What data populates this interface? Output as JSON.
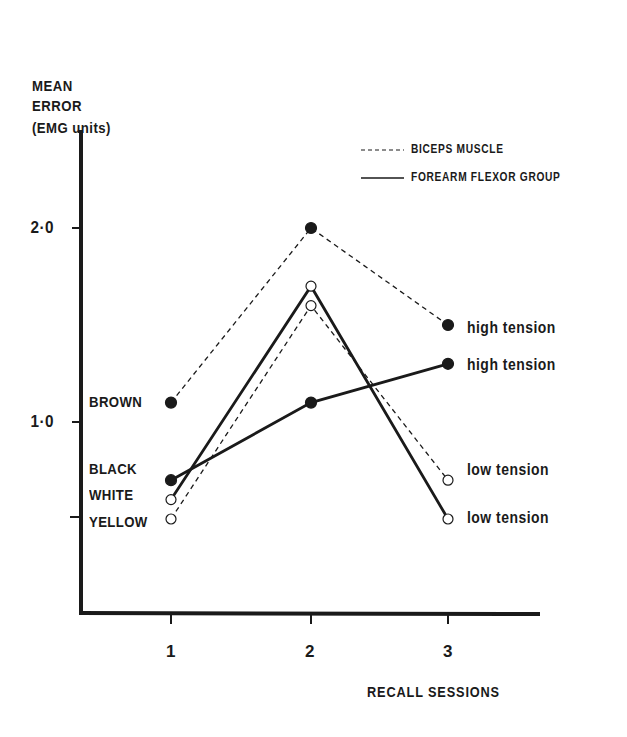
{
  "chart_data": {
    "type": "line",
    "title": "",
    "ylabel_lines": [
      "MEAN",
      "ERROR",
      "(EMG units)"
    ],
    "xlabel": "RECALL SESSIONS",
    "x": [
      1,
      2,
      3
    ],
    "x_tick_labels": [
      "1",
      "2",
      "3"
    ],
    "y_tick_labels": [
      "2·0",
      "1·0"
    ],
    "y_ticks": [
      2.0,
      1.0,
      0.5
    ],
    "ylim": [
      0,
      2.4
    ],
    "grid": false,
    "legend": {
      "position": "top-right",
      "entries": [
        {
          "label": "BICEPS MUSCLE",
          "style": "dashed"
        },
        {
          "label": "FOREARM FLEXOR GROUP",
          "style": "solid"
        }
      ]
    },
    "series": [
      {
        "name": "Biceps muscle - high tension",
        "muscle": "BICEPS MUSCLE",
        "tension": "high tension",
        "line": "dashed",
        "marker": "filled",
        "values": [
          1.1,
          2.0,
          1.5
        ]
      },
      {
        "name": "Biceps muscle - low tension",
        "muscle": "BICEPS MUSCLE",
        "tension": "low tension",
        "line": "dashed",
        "marker": "open",
        "values": [
          0.5,
          1.6,
          0.7
        ]
      },
      {
        "name": "Forearm flexor group - high tension",
        "muscle": "FOREARM FLEXOR GROUP",
        "tension": "high tension",
        "line": "solid",
        "marker": "filled",
        "values": [
          0.7,
          1.1,
          1.3
        ]
      },
      {
        "name": "Forearm flexor group - low tension",
        "muscle": "FOREARM FLEXOR GROUP",
        "tension": "low tension",
        "line": "solid",
        "marker": "open",
        "values": [
          0.6,
          1.7,
          0.5
        ]
      }
    ],
    "start_point_labels": [
      "BROWN",
      "BLACK",
      "WHITE",
      "YELLOW"
    ],
    "end_point_labels": [
      "high tension",
      "high tension",
      "low tension",
      "low tension"
    ]
  },
  "colors": {
    "ink": "#1a1a1a",
    "background": "#ffffff"
  }
}
